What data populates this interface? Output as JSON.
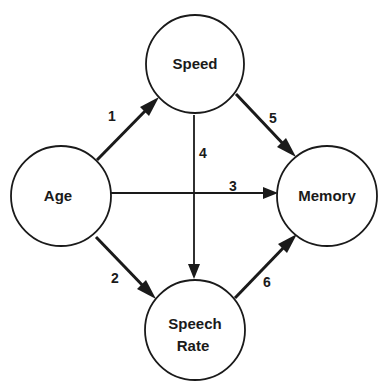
{
  "nodes": {
    "speed": {
      "label": "Speed",
      "cx": 195,
      "cy": 64,
      "r": 49
    },
    "age": {
      "label": "Age",
      "cx": 61,
      "cy": 196,
      "r": 50
    },
    "memory": {
      "label": "Memory",
      "cx": 327,
      "cy": 196,
      "r": 50
    },
    "speech_rate": {
      "label_line1": "Speech",
      "label_line2": "Rate",
      "cx": 195,
      "cy": 330,
      "r": 50
    }
  },
  "edges": [
    {
      "id": "1",
      "label": "1",
      "from": "Age",
      "to": "Speed",
      "weight": "thick"
    },
    {
      "id": "2",
      "label": "2",
      "from": "Age",
      "to": "Speech Rate",
      "weight": "thick"
    },
    {
      "id": "3",
      "label": "3",
      "from": "Age",
      "to": "Memory",
      "weight": "thin"
    },
    {
      "id": "4",
      "label": "4",
      "from": "Speed",
      "to": "Speech Rate",
      "weight": "thin"
    },
    {
      "id": "5",
      "label": "5",
      "from": "Speed",
      "to": "Memory",
      "weight": "thick"
    },
    {
      "id": "6",
      "label": "6",
      "from": "Speech Rate",
      "to": "Memory",
      "weight": "thick"
    }
  ],
  "colors": {
    "stroke": "#1a1a1a",
    "background": "#ffffff"
  }
}
